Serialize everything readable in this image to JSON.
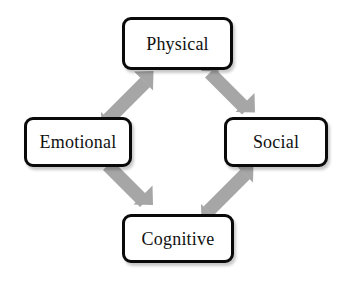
{
  "diagram": {
    "background_color": "#ffffff",
    "box_border_color": "#0a0a0a",
    "box_fill_color": "#ffffff",
    "arrow_color": "#a6a6a6",
    "text_color": "#111111",
    "nodes": [
      {
        "id": "physical",
        "label": "Physical",
        "position": "top"
      },
      {
        "id": "emotional",
        "label": "Emotional",
        "position": "left"
      },
      {
        "id": "social",
        "label": "Social",
        "position": "right"
      },
      {
        "id": "cognitive",
        "label": "Cognitive",
        "position": "bottom"
      }
    ],
    "arrows": [
      {
        "id": "emotional-to-physical",
        "from": "Emotional",
        "to": "Physical",
        "direction": "up-right"
      },
      {
        "id": "physical-to-social",
        "from": "Physical",
        "to": "Social",
        "direction": "down-right"
      },
      {
        "id": "emotional-to-cognitive",
        "from": "Emotional",
        "to": "Cognitive",
        "direction": "down-right"
      },
      {
        "id": "cognitive-to-social",
        "from": "Cognitive",
        "to": "Social",
        "direction": "up-right"
      }
    ]
  }
}
